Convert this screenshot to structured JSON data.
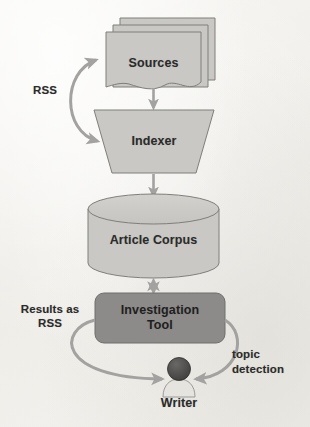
{
  "diagram": {
    "background_color": "#f2f1ed",
    "node_fill_light": "#c9c8c4",
    "node_fill_dark": "#8c8b89",
    "stroke_color": "#7f7e7b",
    "arrow_color": "#a3a2a0",
    "text_color": "#2b2b2b",
    "nodes": [
      {
        "id": "sources",
        "label": "Sources",
        "shape": "document-stack",
        "fill": "light"
      },
      {
        "id": "indexer",
        "label": "Indexer",
        "shape": "trapezoid",
        "fill": "light"
      },
      {
        "id": "article-corpus",
        "label": "Article Corpus",
        "shape": "cylinder",
        "fill": "light"
      },
      {
        "id": "investigation-tool",
        "label": "Investigation\nTool",
        "shape": "rounded-rect",
        "fill": "dark"
      },
      {
        "id": "writer",
        "label": "Writer",
        "shape": "person-icon",
        "fill": "light"
      }
    ],
    "edges": [
      {
        "id": "sources-to-indexer",
        "from": "sources",
        "to": "indexer",
        "label": "",
        "style": "straight",
        "arrows": "single"
      },
      {
        "id": "rss-feedback",
        "from": "indexer",
        "to": "sources",
        "label": "RSS",
        "style": "curved",
        "arrows": "double"
      },
      {
        "id": "indexer-to-corpus",
        "from": "indexer",
        "to": "article-corpus",
        "label": "",
        "style": "straight",
        "arrows": "single"
      },
      {
        "id": "corpus-to-tool",
        "from": "article-corpus",
        "to": "investigation-tool",
        "label": "",
        "style": "straight",
        "arrows": "double"
      },
      {
        "id": "tool-to-writer",
        "from": "investigation-tool",
        "to": "writer",
        "label": "Results as\nRSS",
        "style": "curved",
        "arrows": "single"
      },
      {
        "id": "writer-to-tool",
        "from": "writer",
        "to": "investigation-tool",
        "label": "topic\ndetection",
        "style": "curved",
        "arrows": "single"
      }
    ],
    "labels": {
      "sources": "Sources",
      "indexer": "Indexer",
      "article_corpus": "Article Corpus",
      "investigation_tool_line1": "Investigation",
      "investigation_tool_line2": "Tool",
      "writer": "Writer",
      "rss": "RSS",
      "results_as_rss_line1": "Results as",
      "results_as_rss_line2": "RSS",
      "topic_detection_line1": "topic",
      "topic_detection_line2": "detection"
    }
  }
}
